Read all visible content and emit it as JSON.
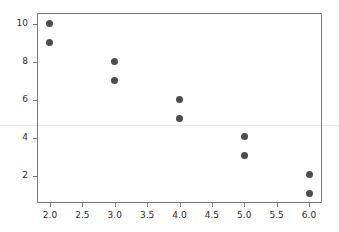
{
  "chart_data": {
    "type": "scatter",
    "title": "",
    "xlabel": "",
    "ylabel": "",
    "xlim": [
      1.8,
      6.2
    ],
    "ylim": [
      0.6,
      10.55
    ],
    "grid": false,
    "legend": null,
    "marker_color": "#4d4d4d",
    "marker_size": 7,
    "axes_color": "#7a7a7a",
    "background_color": "#ffffff",
    "reference_line": {
      "orientation": "horizontal",
      "y": 4.7,
      "color": "#eceaea"
    },
    "x": [
      2,
      2,
      3,
      3,
      4,
      4,
      5,
      5,
      6,
      6
    ],
    "y": [
      10,
      9,
      8,
      7,
      6,
      5,
      4.1,
      3.1,
      2.1,
      1.1
    ],
    "points": [
      {
        "x": 2,
        "y": 10
      },
      {
        "x": 2,
        "y": 9
      },
      {
        "x": 3,
        "y": 8
      },
      {
        "x": 3,
        "y": 7
      },
      {
        "x": 4,
        "y": 6
      },
      {
        "x": 4,
        "y": 5
      },
      {
        "x": 5,
        "y": 4.1
      },
      {
        "x": 5,
        "y": 3.1
      },
      {
        "x": 6,
        "y": 2.1
      },
      {
        "x": 6,
        "y": 1.1
      }
    ],
    "xticks": [
      2.0,
      2.5,
      3.0,
      3.5,
      4.0,
      4.5,
      5.0,
      5.5,
      6.0
    ],
    "xticklabels": [
      "2.0",
      "2.5",
      "3.0",
      "3.5",
      "4.0",
      "4.5",
      "5.0",
      "5.5",
      "6.0"
    ],
    "yticks": [
      2,
      4,
      6,
      8,
      10
    ],
    "yticklabels": [
      "2",
      "4",
      "6",
      "8",
      "10"
    ]
  }
}
